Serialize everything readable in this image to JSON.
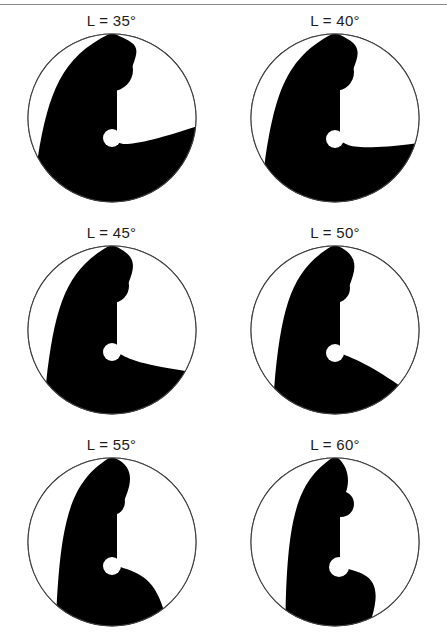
{
  "figure": {
    "background_color": "#ffffff",
    "ink_color": "#000000",
    "outline_color": "#404040",
    "label_color": "#1c1c1c",
    "top_rule": {
      "name": "horizontal-rule",
      "color": "#8a8a8a",
      "y": 4
    },
    "layout": {
      "columns": 2,
      "rows": 3,
      "panel_width": 223,
      "panel_height": 212
    }
  },
  "chart_data": {
    "type": "diagram",
    "parameter_name": "L",
    "parameter_unit": "degrees",
    "parameter_values": [
      35,
      40,
      45,
      50,
      55,
      60
    ],
    "xlabel": "",
    "ylabel": "",
    "grid": false,
    "legend": "none",
    "panels": [
      {
        "index": 0,
        "label": "L = 35°",
        "L": 35,
        "row": 0,
        "column": 0,
        "radius": 84,
        "head_radius": 21,
        "stem_half_width": 5,
        "light_eye_radius": 9,
        "dark_eye_radius": 0,
        "head_cy_offset": -48,
        "light_eye_cy_offset": 20,
        "arc_sweep_deg": 35,
        "tail_fill": "black-dominant"
      },
      {
        "index": 1,
        "label": "L = 40°",
        "L": 40,
        "row": 0,
        "column": 1,
        "radius": 84,
        "head_radius": 19,
        "stem_half_width": 5,
        "light_eye_radius": 9,
        "dark_eye_radius": 0,
        "head_cy_offset": -46,
        "light_eye_cy_offset": 21,
        "arc_sweep_deg": 40,
        "tail_fill": "black-dominant"
      },
      {
        "index": 2,
        "label": "L = 45°",
        "L": 45,
        "row": 1,
        "column": 0,
        "radius": 84,
        "head_radius": 17,
        "stem_half_width": 5,
        "light_eye_radius": 9,
        "dark_eye_radius": 0,
        "head_cy_offset": -44,
        "light_eye_cy_offset": 22,
        "arc_sweep_deg": 45,
        "tail_fill": "balanced"
      },
      {
        "index": 3,
        "label": "L = 50°",
        "L": 50,
        "row": 1,
        "column": 1,
        "radius": 84,
        "head_radius": 15,
        "stem_half_width": 5,
        "light_eye_radius": 9,
        "dark_eye_radius": 0,
        "head_cy_offset": -42,
        "light_eye_cy_offset": 23,
        "arc_sweep_deg": 50,
        "tail_fill": "balanced"
      },
      {
        "index": 4,
        "label": "L = 55°",
        "L": 55,
        "row": 2,
        "column": 0,
        "radius": 84,
        "head_radius": 13,
        "stem_half_width": 5,
        "light_eye_radius": 9,
        "dark_eye_radius": 0,
        "head_cy_offset": -40,
        "light_eye_cy_offset": 24,
        "arc_sweep_deg": 55,
        "tail_fill": "white-growing"
      },
      {
        "index": 5,
        "label": "L = 60°",
        "L": 60,
        "row": 2,
        "column": 1,
        "radius": 84,
        "head_radius": 0,
        "stem_half_width": 5,
        "light_eye_radius": 10,
        "dark_eye_radius": 13,
        "head_cy_offset": -38,
        "light_eye_cy_offset": 25,
        "arc_sweep_deg": 60,
        "tail_fill": "white-growing"
      }
    ]
  }
}
